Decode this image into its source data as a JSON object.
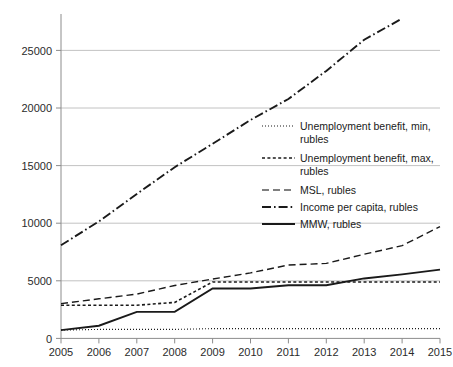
{
  "chart_data": {
    "type": "line",
    "title": "",
    "subtitle": "",
    "xlabel": "",
    "ylabel": "",
    "x": [
      2005,
      2006,
      2007,
      2008,
      2009,
      2010,
      2011,
      2012,
      2013,
      2014,
      2015
    ],
    "xtick_labels": [
      "2005",
      "2006",
      "2007",
      "2008",
      "2009",
      "2010",
      "2011",
      "2012",
      "2013",
      "2014",
      "2015"
    ],
    "ytick_labels": [
      "0",
      "5000",
      "10000",
      "15000",
      "20000",
      "25000"
    ],
    "yticks": [
      0,
      5000,
      10000,
      15000,
      20000,
      25000
    ],
    "ylim": [
      0,
      28000
    ],
    "xlim": [
      2005,
      2015
    ],
    "grid": "horizontal",
    "legend_position": "inside-right",
    "series": [
      {
        "name": "Unemployment benefit, min, rubles",
        "style": "dotted",
        "color": "#1a1a1a",
        "values": [
          720,
          781,
          781,
          781,
          850,
          850,
          850,
          850,
          850,
          850,
          850
        ]
      },
      {
        "name": "Unemployment benefit, max, rubles",
        "style": "dashed-short",
        "color": "#1a1a1a",
        "values": [
          2880,
          2880,
          2880,
          3124,
          4900,
          4900,
          4900,
          4900,
          4900,
          4900,
          4900
        ]
      },
      {
        "name": "MSL, rubles",
        "style": "dashed-long",
        "color": "#555555",
        "values": [
          3018,
          3437,
          3847,
          4593,
          5153,
          5688,
          6369,
          6510,
          7306,
          8050,
          9701
        ]
      },
      {
        "name": "Income per capita, rubles",
        "style": "dash-dot",
        "color": "#1a1a1a",
        "values": [
          8088,
          10155,
          12540,
          14864,
          16895,
          18958,
          20780,
          23221,
          25928,
          27766,
          null
        ]
      },
      {
        "name": "MMW, rubles",
        "style": "solid",
        "color": "#1a1a1a",
        "values": [
          720,
          1100,
          2300,
          2300,
          4330,
          4330,
          4611,
          4611,
          5205,
          5554,
          5965
        ]
      }
    ],
    "legend_entries": [
      {
        "label_line1": "Unemployment benefit, min,",
        "label_line2": "rubles",
        "style": "dotted"
      },
      {
        "label_line1": "Unemployment benefit, max,",
        "label_line2": "rubles",
        "style": "dashed-short"
      },
      {
        "label_line1": "MSL, rubles",
        "label_line2": "",
        "style": "dashed-long"
      },
      {
        "label_line1": "Income per capita, rubles",
        "label_line2": "",
        "style": "dash-dot"
      },
      {
        "label_line1": "MMW, rubles",
        "label_line2": "",
        "style": "solid"
      }
    ]
  },
  "axis": {
    "y_labels": [
      "25000",
      "20000",
      "15000",
      "10000",
      "5000",
      "0"
    ],
    "x_labels": [
      "2005",
      "2006",
      "2007",
      "2008",
      "2009",
      "2010",
      "2011",
      "2012",
      "2013",
      "2014",
      "2015"
    ]
  },
  "legend": {
    "items": [
      "Unemployment benefit, min, rubles",
      "Unemployment benefit, max, rubles",
      "MSL, rubles",
      "Income per capita, rubles",
      "MMW, rubles"
    ]
  },
  "colors": {
    "line": "#1a1a1a",
    "grid": "#b3b3b3",
    "axis": "#8c8c8c",
    "background": "#ffffff"
  }
}
